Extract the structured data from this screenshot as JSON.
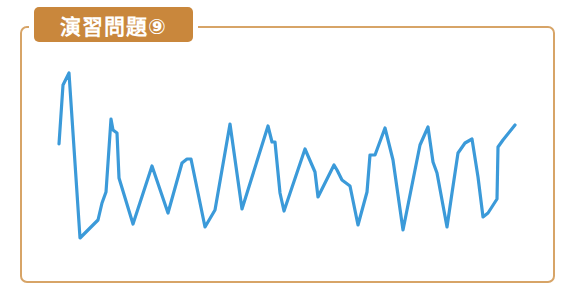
{
  "header": {
    "title": "演習問題⑨"
  },
  "colors": {
    "frame": "#d7a467",
    "title_bg": "#c9873c",
    "line": "#3b9ad9"
  },
  "chart_data": {
    "type": "line",
    "title": "演習問題⑨",
    "xlabel": "",
    "ylabel": "",
    "grid": false,
    "axes": false,
    "note": "Unlabeled waveform; points are pixel coordinates (x, y) in a 571x298 canvas",
    "points": [
      [
        59,
        144
      ],
      [
        63,
        85
      ],
      [
        69,
        73
      ],
      [
        80,
        238
      ],
      [
        98,
        220
      ],
      [
        102,
        203
      ],
      [
        106,
        192
      ],
      [
        111,
        119
      ],
      [
        113,
        130
      ],
      [
        117,
        133
      ],
      [
        119,
        178
      ],
      [
        133,
        224
      ],
      [
        152,
        166
      ],
      [
        168,
        213
      ],
      [
        182,
        163
      ],
      [
        187,
        159
      ],
      [
        191,
        159
      ],
      [
        205,
        227
      ],
      [
        215,
        210
      ],
      [
        230,
        124
      ],
      [
        242,
        209
      ],
      [
        268,
        126
      ],
      [
        272,
        142
      ],
      [
        275,
        142
      ],
      [
        280,
        193
      ],
      [
        284,
        211
      ],
      [
        305,
        149
      ],
      [
        315,
        172
      ],
      [
        318,
        197
      ],
      [
        334,
        165
      ],
      [
        337,
        170
      ],
      [
        342,
        180
      ],
      [
        350,
        186
      ],
      [
        358,
        225
      ],
      [
        367,
        192
      ],
      [
        370,
        155
      ],
      [
        375,
        155
      ],
      [
        385,
        128
      ],
      [
        393,
        160
      ],
      [
        403,
        230
      ],
      [
        420,
        145
      ],
      [
        428,
        127
      ],
      [
        433,
        162
      ],
      [
        437,
        173
      ],
      [
        447,
        227
      ],
      [
        452,
        193
      ],
      [
        458,
        153
      ],
      [
        465,
        143
      ],
      [
        472,
        139
      ],
      [
        478,
        177
      ],
      [
        483,
        217
      ],
      [
        488,
        213
      ],
      [
        497,
        199
      ],
      [
        498,
        147
      ],
      [
        503,
        140
      ],
      [
        515,
        125
      ]
    ]
  }
}
